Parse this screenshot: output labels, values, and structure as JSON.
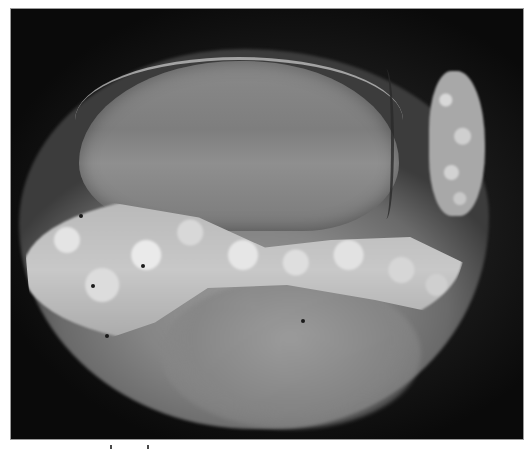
{
  "figure": {
    "type": "clinical-photograph",
    "color_mode": "grayscale",
    "background_color": "#0c0c0c",
    "frame_border_color": "#9a9a9a",
    "page_background": "#ffffff",
    "caption_marks_count": 2
  }
}
